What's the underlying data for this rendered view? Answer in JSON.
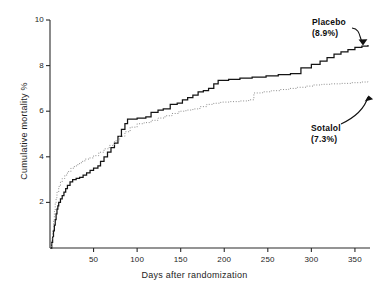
{
  "figure": {
    "background": "#ffffff",
    "axis_color": "#2b2b2b"
  },
  "axes": {
    "x_title": "Days after randomization",
    "y_title": "Cumulative mortality %",
    "x_ticks": [
      "50",
      "100",
      "150",
      "200",
      "250",
      "300",
      "350"
    ],
    "y_ticks": [
      "2",
      "4",
      "6",
      "8",
      "10"
    ]
  },
  "annotations": {
    "placebo": {
      "name": "Placebo",
      "value": "(8.9%)"
    },
    "sotalol": {
      "name": "Sotalol",
      "value": "(7.3%)"
    }
  },
  "chart_data": {
    "type": "line",
    "title": "",
    "subtitle": "",
    "xlabel": "Days after randomization",
    "ylabel": "Cumulative mortality %",
    "xlim": [
      0,
      365
    ],
    "ylim": [
      0,
      10
    ],
    "xticks": [
      50,
      100,
      150,
      200,
      250,
      300,
      350
    ],
    "yticks": [
      2,
      4,
      6,
      8,
      10
    ],
    "grid": false,
    "legend_position": "inline-annotations",
    "step_style": "post",
    "annotations": [
      {
        "text": "Placebo",
        "value_text": "(8.9%)",
        "final_value": 8.9,
        "points_to_series": "Placebo"
      },
      {
        "text": "Sotalol",
        "value_text": "(7.3%)",
        "final_value": 7.3,
        "points_to_series": "Sotalol"
      }
    ],
    "series": [
      {
        "name": "Placebo",
        "style": "solid",
        "color": "#141414",
        "final_value": 8.9,
        "points": [
          [
            0,
            0.0
          ],
          [
            2,
            0.25
          ],
          [
            3,
            0.5
          ],
          [
            4,
            0.75
          ],
          [
            5,
            1.0
          ],
          [
            6,
            1.25
          ],
          [
            7,
            1.5
          ],
          [
            8,
            1.7
          ],
          [
            9,
            1.85
          ],
          [
            10,
            2.0
          ],
          [
            12,
            2.15
          ],
          [
            14,
            2.3
          ],
          [
            16,
            2.45
          ],
          [
            18,
            2.6
          ],
          [
            20,
            2.75
          ],
          [
            23,
            2.9
          ],
          [
            26,
            3.0
          ],
          [
            30,
            3.05
          ],
          [
            34,
            3.1
          ],
          [
            38,
            3.2
          ],
          [
            42,
            3.3
          ],
          [
            46,
            3.4
          ],
          [
            50,
            3.5
          ],
          [
            55,
            3.6
          ],
          [
            58,
            3.8
          ],
          [
            62,
            4.0
          ],
          [
            66,
            4.2
          ],
          [
            70,
            4.4
          ],
          [
            74,
            4.6
          ],
          [
            78,
            4.9
          ],
          [
            82,
            5.2
          ],
          [
            86,
            5.45
          ],
          [
            89,
            5.65
          ],
          [
            100,
            5.7
          ],
          [
            110,
            5.75
          ],
          [
            116,
            5.95
          ],
          [
            124,
            6.05
          ],
          [
            130,
            6.1
          ],
          [
            138,
            6.3
          ],
          [
            146,
            6.35
          ],
          [
            152,
            6.5
          ],
          [
            158,
            6.6
          ],
          [
            164,
            6.7
          ],
          [
            170,
            6.85
          ],
          [
            176,
            6.9
          ],
          [
            182,
            7.0
          ],
          [
            188,
            7.2
          ],
          [
            193,
            7.35
          ],
          [
            205,
            7.4
          ],
          [
            218,
            7.45
          ],
          [
            232,
            7.5
          ],
          [
            248,
            7.55
          ],
          [
            262,
            7.6
          ],
          [
            276,
            7.65
          ],
          [
            288,
            7.9
          ],
          [
            300,
            8.05
          ],
          [
            310,
            8.2
          ],
          [
            318,
            8.35
          ],
          [
            326,
            8.5
          ],
          [
            334,
            8.6
          ],
          [
            342,
            8.7
          ],
          [
            350,
            8.8
          ],
          [
            358,
            8.85
          ],
          [
            365,
            8.9
          ]
        ]
      },
      {
        "name": "Sotalol",
        "style": "dotted",
        "color": "#8d8d8d",
        "final_value": 7.3,
        "points": [
          [
            0,
            0.0
          ],
          [
            2,
            0.4
          ],
          [
            3,
            0.8
          ],
          [
            4,
            1.2
          ],
          [
            5,
            1.6
          ],
          [
            6,
            1.95
          ],
          [
            7,
            2.2
          ],
          [
            8,
            2.45
          ],
          [
            10,
            2.7
          ],
          [
            12,
            2.9
          ],
          [
            14,
            3.05
          ],
          [
            17,
            3.2
          ],
          [
            20,
            3.35
          ],
          [
            24,
            3.5
          ],
          [
            28,
            3.6
          ],
          [
            32,
            3.7
          ],
          [
            36,
            3.8
          ],
          [
            40,
            3.9
          ],
          [
            45,
            3.95
          ],
          [
            50,
            4.05
          ],
          [
            56,
            4.2
          ],
          [
            62,
            4.35
          ],
          [
            68,
            4.5
          ],
          [
            74,
            4.7
          ],
          [
            80,
            4.9
          ],
          [
            86,
            5.1
          ],
          [
            92,
            5.3
          ],
          [
            100,
            5.45
          ],
          [
            108,
            5.5
          ],
          [
            116,
            5.6
          ],
          [
            124,
            5.7
          ],
          [
            132,
            5.8
          ],
          [
            140,
            5.9
          ],
          [
            148,
            6.0
          ],
          [
            156,
            6.05
          ],
          [
            164,
            6.1
          ],
          [
            172,
            6.2
          ],
          [
            180,
            6.3
          ],
          [
            188,
            6.35
          ],
          [
            196,
            6.4
          ],
          [
            206,
            6.42
          ],
          [
            218,
            6.45
          ],
          [
            228,
            6.5
          ],
          [
            234,
            6.8
          ],
          [
            244,
            6.85
          ],
          [
            254,
            6.9
          ],
          [
            264,
            6.95
          ],
          [
            274,
            7.0
          ],
          [
            284,
            7.05
          ],
          [
            294,
            7.1
          ],
          [
            302,
            7.15
          ],
          [
            312,
            7.18
          ],
          [
            322,
            7.2
          ],
          [
            334,
            7.22
          ],
          [
            346,
            7.25
          ],
          [
            358,
            7.28
          ],
          [
            365,
            7.3
          ]
        ]
      }
    ]
  }
}
